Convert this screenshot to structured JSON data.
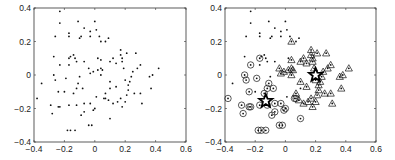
{
  "chart_data": [
    {
      "type": "scatter",
      "title": "",
      "xlabel": "",
      "ylabel": "",
      "xlim": [
        -0.4,
        0.6
      ],
      "ylim": [
        -0.4,
        0.4
      ],
      "xticks": [
        "-0.4",
        "-0.2",
        "0",
        "0.2",
        "0.4",
        "0.6"
      ],
      "yticks": [
        "0.4",
        "0.2",
        "0",
        "-0.2",
        "-0.4"
      ],
      "grid": false,
      "legend": null,
      "series": [
        {
          "name": "points",
          "marker": "dot",
          "points": "shared"
        }
      ]
    },
    {
      "type": "scatter",
      "title": "",
      "xlabel": "",
      "ylabel": "",
      "xlim": [
        -0.4,
        0.6
      ],
      "ylim": [
        -0.4,
        0.4
      ],
      "xticks": [
        "-0.4",
        "-0.2",
        "0",
        "0.2",
        "0.4",
        "0.6"
      ],
      "yticks": [
        "0.4",
        "0.2",
        "0",
        "-0.2",
        "-0.4"
      ],
      "grid": false,
      "legend": null,
      "series": [
        {
          "name": "unlabeled",
          "marker": "dot"
        },
        {
          "name": "cluster 1",
          "marker": "circle"
        },
        {
          "name": "cluster 2",
          "marker": "triangle"
        },
        {
          "name": "centers",
          "marker": "star",
          "points": [
            [
              -0.13,
              -0.155
            ],
            [
              0.2,
              0.0
            ]
          ]
        }
      ]
    }
  ],
  "points": [
    [
      -0.23,
      0.38,
      "d"
    ],
    [
      -0.23,
      0.31,
      "d"
    ],
    [
      -0.11,
      0.32,
      "d"
    ],
    [
      0.0,
      0.32,
      "d"
    ],
    [
      0.01,
      0.27,
      "d"
    ],
    [
      -0.07,
      0.28,
      "d"
    ],
    [
      -0.26,
      0.23,
      "d"
    ],
    [
      -0.17,
      0.25,
      "d"
    ],
    [
      -0.17,
      0.23,
      "d"
    ],
    [
      -0.1,
      0.22,
      "d"
    ],
    [
      -0.09,
      0.23,
      "d"
    ],
    [
      -0.03,
      0.26,
      "d"
    ],
    [
      -0.03,
      0.23,
      "d"
    ],
    [
      0.03,
      0.23,
      "d"
    ],
    [
      0.04,
      0.2,
      "t"
    ],
    [
      0.07,
      0.2,
      "d"
    ],
    [
      0.09,
      0.22,
      "d"
    ],
    [
      -0.27,
      0.11,
      "d"
    ],
    [
      -0.16,
      0.11,
      "d"
    ],
    [
      -0.17,
      0.1,
      "c"
    ],
    [
      -0.14,
      0.12,
      "d"
    ],
    [
      -0.13,
      0.1,
      "d"
    ],
    [
      -0.23,
      0.06,
      "c"
    ],
    [
      -0.17,
      0.06,
      "d"
    ],
    [
      -0.12,
      0.08,
      "d"
    ],
    [
      -0.07,
      0.08,
      "d"
    ],
    [
      -0.04,
      0.04,
      "t"
    ],
    [
      -0.03,
      0.01,
      "t"
    ],
    [
      -0.01,
      0.02,
      "t"
    ],
    [
      0.02,
      0.1,
      "d"
    ],
    [
      0.04,
      0.09,
      "t"
    ],
    [
      0.02,
      0.03,
      "t"
    ],
    [
      0.04,
      0.04,
      "t"
    ],
    [
      0.05,
      0.03,
      "t"
    ],
    [
      0.04,
      0.0,
      "t"
    ],
    [
      0.1,
      0.08,
      "t"
    ],
    [
      0.12,
      0.1,
      "t"
    ],
    [
      0.14,
      0.07,
      "t"
    ],
    [
      0.17,
      0.15,
      "t"
    ],
    [
      0.17,
      0.12,
      "t"
    ],
    [
      0.18,
      0.1,
      "t"
    ],
    [
      0.18,
      0.08,
      "t"
    ],
    [
      0.19,
      0.04,
      "t"
    ],
    [
      0.21,
      0.13,
      "t"
    ],
    [
      0.27,
      0.13,
      "t"
    ],
    [
      0.28,
      0.04,
      "t"
    ],
    [
      0.3,
      0.06,
      "t"
    ],
    [
      0.25,
      0.02,
      "t"
    ],
    [
      0.24,
      -0.01,
      "t"
    ],
    [
      0.2,
      -0.03,
      "t"
    ],
    [
      0.36,
      -0.01,
      "t"
    ],
    [
      0.38,
      0.0,
      "t"
    ],
    [
      0.42,
      0.04,
      "t"
    ],
    [
      0.37,
      -0.08,
      "t"
    ],
    [
      -0.27,
      0.0,
      "c"
    ],
    [
      -0.26,
      -0.03,
      "c"
    ],
    [
      -0.35,
      -0.05,
      "d"
    ],
    [
      -0.19,
      -0.02,
      "c"
    ],
    [
      -0.1,
      -0.01,
      "d"
    ],
    [
      -0.11,
      -0.05,
      "c"
    ],
    [
      -0.12,
      -0.08,
      "c"
    ],
    [
      -0.24,
      -0.1,
      "c"
    ],
    [
      -0.2,
      -0.1,
      "d"
    ],
    [
      -0.08,
      -0.08,
      "c"
    ],
    [
      -0.14,
      -0.11,
      "c"
    ],
    [
      -0.38,
      -0.14,
      "c"
    ],
    [
      -0.29,
      -0.18,
      "c"
    ],
    [
      -0.28,
      -0.23,
      "c"
    ],
    [
      -0.24,
      -0.19,
      "c"
    ],
    [
      -0.23,
      -0.19,
      "c"
    ],
    [
      -0.17,
      -0.18,
      "c"
    ],
    [
      -0.12,
      -0.18,
      "c"
    ],
    [
      -0.07,
      -0.17,
      "c"
    ],
    [
      -0.09,
      -0.24,
      "c"
    ],
    [
      -0.07,
      -0.22,
      "c"
    ],
    [
      -0.03,
      -0.17,
      "c"
    ],
    [
      0.0,
      -0.2,
      "c"
    ],
    [
      -0.01,
      -0.21,
      "c"
    ],
    [
      -0.04,
      -0.3,
      "c"
    ],
    [
      -0.02,
      -0.3,
      "c"
    ],
    [
      -0.18,
      -0.33,
      "c"
    ],
    [
      -0.16,
      -0.33,
      "c"
    ],
    [
      -0.13,
      -0.33,
      "c"
    ],
    [
      0.1,
      -0.26,
      "c"
    ],
    [
      0.01,
      -0.13,
      "d"
    ],
    [
      0.06,
      -0.14,
      "c"
    ],
    [
      0.07,
      -0.14,
      "c"
    ],
    [
      0.09,
      -0.15,
      "t"
    ],
    [
      0.1,
      -0.04,
      "t"
    ],
    [
      0.14,
      -0.07,
      "t"
    ],
    [
      0.12,
      -0.17,
      "t"
    ],
    [
      0.15,
      -0.16,
      "t"
    ],
    [
      0.18,
      -0.19,
      "t"
    ],
    [
      0.2,
      -0.16,
      "t"
    ],
    [
      0.21,
      -0.12,
      "t"
    ],
    [
      0.22,
      -0.06,
      "t"
    ],
    [
      0.26,
      -0.11,
      "t"
    ],
    [
      0.3,
      -0.11,
      "t"
    ],
    [
      0.31,
      -0.17,
      "t"
    ],
    [
      0.07,
      -0.11,
      "t"
    ],
    [
      0.1,
      -0.08,
      "d"
    ],
    [
      0.17,
      -0.14,
      "t"
    ],
    [
      0.22,
      -0.09,
      "t"
    ],
    [
      0.23,
      -0.04,
      "t"
    ]
  ],
  "stars": [
    [
      -0.13,
      -0.155
    ],
    [
      0.2,
      0.0
    ]
  ],
  "panels": [
    {
      "id": "left",
      "x0": 34,
      "x1": 186,
      "y0": 8,
      "y1": 142
    },
    {
      "id": "right",
      "x0": 225,
      "x1": 376,
      "y0": 8,
      "y1": 142
    }
  ],
  "colors": {
    "axis": "#333333",
    "marker": "#111111",
    "text": "#222222"
  }
}
